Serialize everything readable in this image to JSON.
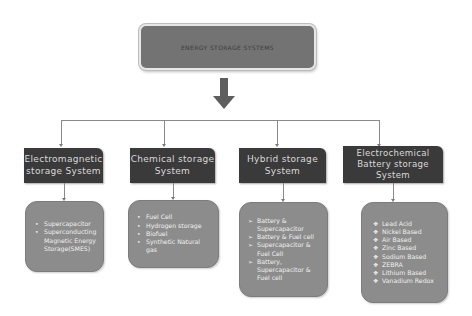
{
  "title": "ENERGY STORAGE SYSTEMS",
  "arrow_icon": "down-arrow-icon",
  "categories": [
    {
      "label": "Electromagnetic storage System",
      "bullet": "•",
      "items": [
        "Supercapacitor",
        "Superconducting Magnetic Energy Storage(SMES)"
      ]
    },
    {
      "label": "Chemical storage System",
      "bullet": "•",
      "items": [
        "Fuel Cell",
        "Hydrogen storage",
        "Biofuel",
        "Synthetic Natural gas"
      ]
    },
    {
      "label": "Hybrid storage System",
      "bullet": "➢",
      "items": [
        "Battery & Supercapacitor",
        "Battery & Fuel cell",
        "Supercapacitor & Fuel Cell",
        "Battery, Supercapacitor & Fuel cell"
      ]
    },
    {
      "label": "Electrochemical Battery storage System",
      "bullet": "❖",
      "items": [
        "Lead Acid",
        "Nickel Based",
        "Air Based",
        "Zinc Based",
        "Sodium Based",
        "ZEBRA",
        "Lithium Based",
        "Vanadium Redox"
      ]
    }
  ],
  "colors": {
    "title_box": "#737373",
    "category_box": "#3a3a3a",
    "content_box": "#8c8c8c",
    "connector": "#8a8a8a"
  }
}
